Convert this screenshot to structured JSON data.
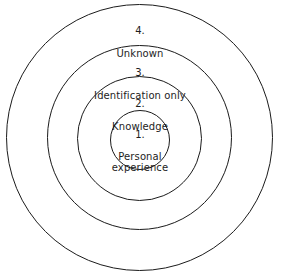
{
  "diagram": {
    "type": "concentric-circles",
    "title": "",
    "background_color": "#ffffff",
    "stroke_color": "#1b1b1b",
    "text_color": "#1d1d1d",
    "rings": [
      {
        "level": "4.",
        "label": "Unknown",
        "order": 4,
        "position": "outermost",
        "center": {
          "x": 140,
          "y": 138
        },
        "radius": 133
      },
      {
        "level": "3.",
        "label": "Identification only",
        "order": 3,
        "position": "third",
        "center": {
          "x": 140,
          "y": 138
        },
        "radius": 92
      },
      {
        "level": "2.",
        "label": "Knowledge",
        "order": 2,
        "position": "second",
        "center": {
          "x": 140,
          "y": 138
        },
        "radius": 62
      },
      {
        "level": "1.",
        "label": "Personal\nexperience",
        "order": 1,
        "position": "innermost",
        "center": {
          "x": 140,
          "y": 140
        },
        "radius": 30
      }
    ]
  }
}
